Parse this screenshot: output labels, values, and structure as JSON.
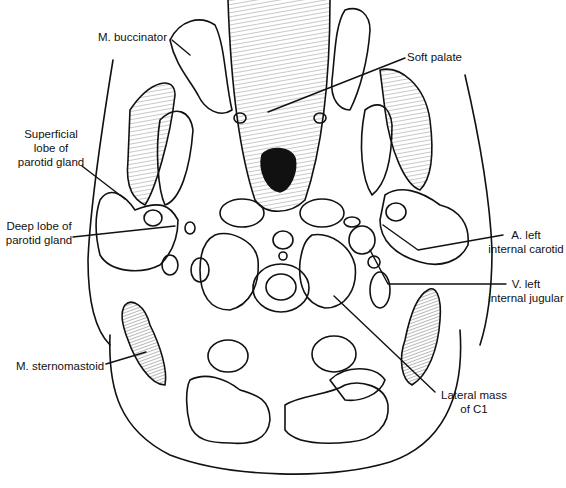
{
  "figure": {
    "background_color": "#ffffff",
    "line_color": "#111111",
    "labels": [
      {
        "id": "m-buccinator",
        "lines": [
          "M. buccinator"
        ]
      },
      {
        "id": "soft-palate",
        "lines": [
          "Soft palate"
        ]
      },
      {
        "id": "superficial-lobe",
        "lines": [
          "Superficial",
          "lobe of",
          "parotid gland"
        ]
      },
      {
        "id": "deep-lobe",
        "lines": [
          "Deep lobe of",
          "parotid gland"
        ]
      },
      {
        "id": "a-left-internal-carotid",
        "lines": [
          "A. left",
          "internal carotid"
        ]
      },
      {
        "id": "v-left-internal-jugular",
        "lines": [
          "V. left",
          "internal jugular"
        ]
      },
      {
        "id": "m-sternomastoid",
        "lines": [
          "M. sternomastoid"
        ]
      },
      {
        "id": "lateral-mass-c1",
        "lines": [
          "Lateral mass",
          "of C1"
        ]
      }
    ]
  }
}
